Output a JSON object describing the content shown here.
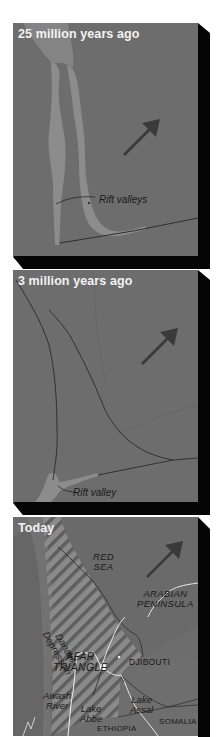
{
  "figure": {
    "panels": [
      {
        "title": "25 million years ago",
        "labels": {
          "rift": "Rift valleys"
        },
        "arrow": "plate-motion-arrow-northeast"
      },
      {
        "title": "3 million years ago",
        "labels": {
          "rift": "Rift valley"
        },
        "arrow": "plate-motion-arrow-northeast"
      },
      {
        "title": "Today",
        "labels": {
          "red_sea_1": "RED",
          "red_sea_2": "SEA",
          "arabian_1": "ARABIAN",
          "arabian_2": "PENINSULA",
          "danakil_1": "Danakil",
          "danakil_2": "Depression",
          "afar_1": "AFAR",
          "afar_2": "TRIANGLE",
          "djibouti": "DJIBOUTI",
          "awash_1": "Awash",
          "awash_2": "River",
          "abbe_1": "Lake",
          "abbe_2": "Abbe",
          "assal_1": "Lake",
          "assal_2": "Assal",
          "somalia": "SOMALIA",
          "ethiopia": "ETHIOPIA"
        },
        "arrow": "plate-motion-arrow-northeast"
      }
    ],
    "colors": {
      "land": "#6d6d6d",
      "rift": "#8c8c8c",
      "shadow": "#050505",
      "arrow": "#3a3a3a",
      "title": "#f2f2f2",
      "river": "#e8e8e8"
    }
  }
}
